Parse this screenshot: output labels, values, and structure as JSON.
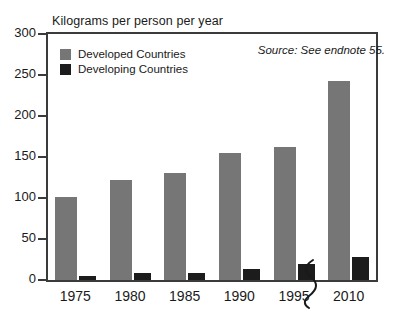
{
  "chart_data": {
    "type": "bar",
    "title": "Kilograms per person per year",
    "xlabel": "",
    "ylabel": "Kilograms per person per year",
    "categories": [
      "1975",
      "1980",
      "1985",
      "1990",
      "1995",
      "2010"
    ],
    "series": [
      {
        "name": "Developed Countries",
        "color": "#767676",
        "values": [
          101,
          122,
          131,
          155,
          162,
          243
        ]
      },
      {
        "name": "Developing Countries",
        "color": "#1c1c1c",
        "values": [
          5,
          8,
          9,
          13,
          19,
          28
        ]
      }
    ],
    "ylim": [
      0,
      300
    ],
    "yticks": [
      0,
      50,
      100,
      150,
      200,
      250,
      300
    ],
    "ytick_labels": [
      "0",
      "50",
      "100",
      "150",
      "200",
      "250",
      "300"
    ],
    "grid": false,
    "legend_position": "top-left",
    "annotations": [
      {
        "name": "axis-break",
        "text": "",
        "note": "zigzag break on x-axis between 1995 and 2010"
      }
    ],
    "source_note": "Source: See endnote 55."
  },
  "legend": {
    "items": [
      {
        "label": "Developed Countries",
        "color": "#767676"
      },
      {
        "label": "Developing Countries",
        "color": "#1c1c1c"
      }
    ]
  },
  "colors": {
    "developed": "#767676",
    "developing": "#1c1c1c",
    "axis": "#3b3b3b",
    "text": "#1a1a1a",
    "background": "#ffffff"
  }
}
